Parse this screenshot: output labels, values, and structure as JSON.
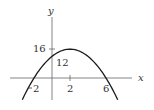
{
  "chart_data": {
    "type": "line",
    "title": "",
    "xlabel": "x",
    "ylabel": "y",
    "function": "y = -x^2 + 4x + 12",
    "x_ticks": [
      {
        "value": -2,
        "label": "-2"
      },
      {
        "value": 2,
        "label": "2"
      },
      {
        "value": 6,
        "label": "6"
      }
    ],
    "y_ticks": [
      {
        "value": 16,
        "label": "16"
      }
    ],
    "annotations": [
      {
        "text": "12",
        "x": 0,
        "y": 12,
        "note": "y-intercept"
      }
    ],
    "key_points": [
      {
        "x": -2,
        "y": 0
      },
      {
        "x": 0,
        "y": 12
      },
      {
        "x": 2,
        "y": 16
      },
      {
        "x": 6,
        "y": 0
      }
    ],
    "series": [
      {
        "name": "parabola",
        "x": [
          -3.3,
          -3,
          -2,
          -1,
          0,
          1,
          2,
          3,
          4,
          5,
          6,
          7,
          7.3
        ],
        "values": [
          -12.09,
          -9,
          0,
          7,
          12,
          15,
          16,
          15,
          12,
          7,
          0,
          -9,
          -12.09
        ]
      }
    ],
    "xlim": [
      -4.6,
      8.9
    ],
    "ylim": [
      -12.5,
      35
    ],
    "grid": false,
    "colors": {
      "curve": "#1a1a1a",
      "axes": "#555555",
      "text": "#333333"
    }
  },
  "labels": {
    "x_axis": "x",
    "y_axis": "y",
    "tick_neg2": "2",
    "tick_neg2_minus": "−",
    "tick_2": "2",
    "tick_6": "6",
    "tick_16": "16",
    "intercept_12": "12"
  }
}
